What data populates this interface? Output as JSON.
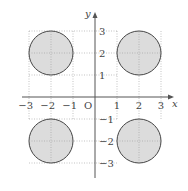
{
  "diagram": {
    "type": "coordinate-plane",
    "axes": {
      "x_label": "x",
      "y_label": "y",
      "origin_label": "O"
    },
    "x_ticks": [
      {
        "value": -3,
        "label": "−3"
      },
      {
        "value": -2,
        "label": "−2"
      },
      {
        "value": -1,
        "label": "−1"
      },
      {
        "value": 1,
        "label": "1"
      },
      {
        "value": 2,
        "label": "2"
      },
      {
        "value": 3,
        "label": "3"
      }
    ],
    "y_ticks": [
      {
        "value": 3,
        "label": "3"
      },
      {
        "value": 2,
        "label": "2"
      },
      {
        "value": 1,
        "label": "1"
      },
      {
        "value": -1,
        "label": "−1"
      },
      {
        "value": -2,
        "label": "−2"
      },
      {
        "value": -3,
        "label": "−3"
      }
    ],
    "circles": [
      {
        "cx": -2,
        "cy": 2,
        "r": 1
      },
      {
        "cx": 2,
        "cy": 2,
        "r": 1
      },
      {
        "cx": -2,
        "cy": -2,
        "r": 1
      },
      {
        "cx": 2,
        "cy": -2,
        "r": 1
      }
    ],
    "colors": {
      "fill": "#dcdcdc",
      "stroke": "#444444",
      "grid": "#9a9a9a",
      "axis": "#555555"
    }
  }
}
